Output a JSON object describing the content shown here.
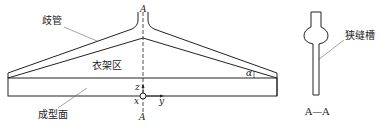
{
  "diagram": {
    "labels": {
      "branch_pipe": "歧管",
      "manifold_area": "衣架区",
      "forming_surface": "成型面",
      "slit_groove": "狭缝槽",
      "section_mark_top": "A",
      "section_mark_bottom": "A",
      "section_title": "A—A",
      "angle": "α",
      "axis_z": "z",
      "axis_x": "x",
      "axis_y": "y"
    },
    "colors": {
      "stroke": "#222222",
      "leader": "#555555",
      "background": "#ffffff"
    }
  }
}
